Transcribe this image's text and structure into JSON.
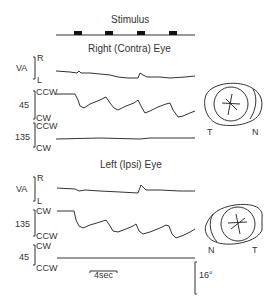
{
  "figure": {
    "stimulus_title": "Stimulus",
    "right_eye_title": "Right (Contra) Eye",
    "left_eye_title": "Left (Ipsi) Eye",
    "right_eye": {
      "va": {
        "name": "VA",
        "top": "R",
        "bottom": "L"
      },
      "ch1": {
        "name": "45",
        "top": "CCW",
        "bottom": "CW"
      },
      "ch2": {
        "name": "135",
        "top": "CCW",
        "bottom": "CW"
      },
      "diagram": {
        "left": "T",
        "right": "N"
      }
    },
    "left_eye": {
      "va": {
        "name": "VA",
        "top": "R",
        "bottom": "L"
      },
      "ch1": {
        "name": "135",
        "top": "CW",
        "bottom": "CCW"
      },
      "ch2": {
        "name": "45",
        "top": "CW",
        "bottom": "CCW"
      },
      "diagram": {
        "left": "N",
        "right": "T"
      }
    },
    "time_scale": "4sec",
    "angle_scale": "16°"
  }
}
